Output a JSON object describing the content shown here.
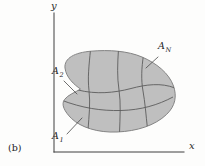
{
  "figure": {
    "caption_label": "(b)",
    "axes": {
      "x_label": "x",
      "y_label": "y",
      "axis_color": "#3f3f3f"
    },
    "region": {
      "fill_color": "#bfbfbf",
      "outline_color": "#848484",
      "grid_line_color": "#5c5c5c",
      "leader_line_color": "#4a4a4a",
      "subregion_labels": [
        {
          "base": "A",
          "subscript": "1"
        },
        {
          "base": "A",
          "subscript": "2"
        },
        {
          "base": "A",
          "subscript": "N"
        }
      ]
    }
  }
}
